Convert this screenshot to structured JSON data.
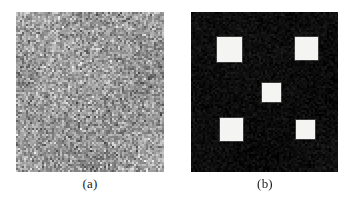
{
  "figure": {
    "background_color": "#ffffff",
    "width": 353,
    "height": 197
  },
  "panels": [
    {
      "id": "a",
      "caption": "(a)",
      "kind": "noise-image",
      "description": "Noisy grayscale image",
      "x": 16,
      "y": 12,
      "width": 148,
      "height": 160,
      "mean_gray": "#9a9a9a",
      "noise_amplitude": 60,
      "pixel_block": 2
    },
    {
      "id": "b",
      "caption": "(b)",
      "kind": "binary-image",
      "description": "Detected bright square targets on dark background",
      "x": 191,
      "y": 12,
      "width": 147,
      "height": 160,
      "background_color": "#0d0d0d",
      "foreground_color": "#f4f4f2",
      "noise_amplitude": 14,
      "pixel_block": 2,
      "squares": [
        {
          "name": "top-left",
          "x": 26,
          "y": 25,
          "size": 25
        },
        {
          "name": "top-right",
          "x": 104,
          "y": 25,
          "size": 23
        },
        {
          "name": "center",
          "x": 71,
          "y": 71,
          "size": 19
        },
        {
          "name": "bottom-left",
          "x": 29,
          "y": 106,
          "size": 23
        },
        {
          "name": "bottom-right",
          "x": 105,
          "y": 108,
          "size": 19
        }
      ]
    }
  ]
}
